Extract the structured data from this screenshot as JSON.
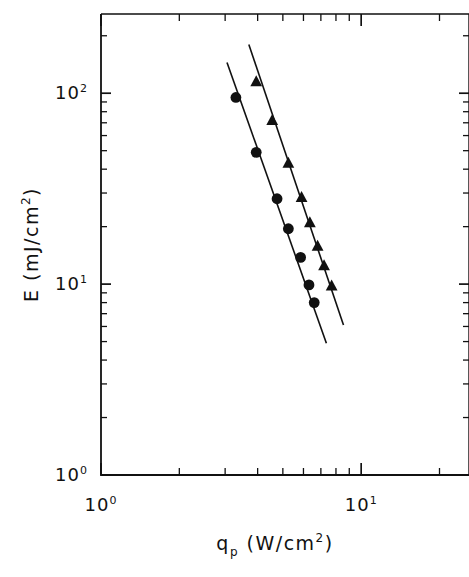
{
  "chart_data": {
    "type": "scatter",
    "title": "",
    "subtitle": "",
    "xlabel": "q_p  (W/cm²)",
    "xlabel_parts": {
      "base": "q",
      "sub": "p",
      "unit": "(W/cm",
      "unit_sup": "2",
      "unit_close": ")"
    },
    "ylabel": "E  (mJ/cm²)",
    "ylabel_parts": {
      "base": "E",
      "unit": "(mJ/cm",
      "unit_sup": "2",
      "unit_close": ")"
    },
    "xscale": "log",
    "yscale": "log",
    "xlim": [
      1,
      14.1
    ],
    "ylim": [
      1,
      260
    ],
    "grid": false,
    "legend": "none",
    "x_tick_labels": [
      {
        "value": 1,
        "mantissa": "10",
        "exponent": "0"
      },
      {
        "value": 10,
        "mantissa": "10",
        "exponent": "1"
      }
    ],
    "y_tick_labels": [
      {
        "value": 100,
        "mantissa": "10",
        "exponent": "2"
      },
      {
        "value": 10,
        "mantissa": "10",
        "exponent": "1"
      },
      {
        "value": 1,
        "mantissa": "10",
        "exponent": "0"
      }
    ],
    "x_minor_ticks": [
      2,
      3,
      4,
      5,
      6,
      7,
      8,
      9,
      20
    ],
    "y_minor_ticks": [
      2,
      3,
      4,
      5,
      6,
      7,
      8,
      9,
      20,
      30,
      40,
      50,
      60,
      70,
      80,
      90,
      200
    ],
    "series": [
      {
        "name": "circles",
        "marker": "filled-circle",
        "color": "#111111",
        "points": [
          {
            "x": 3.3,
            "y": 95.0
          },
          {
            "x": 3.95,
            "y": 49.0
          },
          {
            "x": 4.75,
            "y": 28.0
          },
          {
            "x": 5.25,
            "y": 19.5
          },
          {
            "x": 5.85,
            "y": 13.8
          },
          {
            "x": 6.3,
            "y": 9.9
          },
          {
            "x": 6.6,
            "y": 8.0
          }
        ],
        "fit_line": {
          "x1": 3.05,
          "y1": 145.0,
          "x2": 7.35,
          "y2": 4.9
        },
        "fit_slope": -3.85
      },
      {
        "name": "triangles",
        "marker": "filled-triangle",
        "color": "#111111",
        "points": [
          {
            "x": 3.95,
            "y": 115.0
          },
          {
            "x": 4.55,
            "y": 72.0
          },
          {
            "x": 5.25,
            "y": 43.0
          },
          {
            "x": 5.9,
            "y": 28.5
          },
          {
            "x": 6.35,
            "y": 21.0
          },
          {
            "x": 6.8,
            "y": 15.8
          },
          {
            "x": 7.2,
            "y": 12.5
          },
          {
            "x": 7.7,
            "y": 9.8
          }
        ],
        "fit_line": {
          "x1": 3.7,
          "y1": 180.0,
          "x2": 8.55,
          "y2": 6.1
        },
        "fit_slope": -3.9
      }
    ]
  },
  "figure": {
    "axis_color": "#111111",
    "marker_color": "#111111",
    "background": "#ffffff"
  }
}
